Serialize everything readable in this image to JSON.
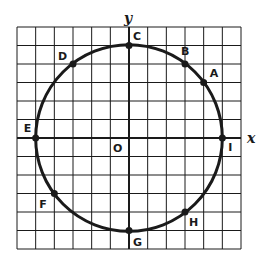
{
  "diagram": {
    "type": "circle-on-coordinate-grid",
    "grid": {
      "cells_x": 12,
      "cells_y": 12,
      "x_min": -6,
      "x_max": 6,
      "y_min": -6,
      "y_max": 6
    },
    "axes": {
      "x_label": "x",
      "y_label": "y",
      "origin_label": "O"
    },
    "circle": {
      "center": [
        0,
        0
      ],
      "radius": 5
    },
    "points": [
      {
        "label": "A",
        "x": 4,
        "y": 3
      },
      {
        "label": "B",
        "x": 3,
        "y": 4
      },
      {
        "label": "C",
        "x": 0,
        "y": 5
      },
      {
        "label": "D",
        "x": -3,
        "y": 4
      },
      {
        "label": "E",
        "x": -5,
        "y": 0
      },
      {
        "label": "F",
        "x": -4,
        "y": -3
      },
      {
        "label": "G",
        "x": 0,
        "y": -5
      },
      {
        "label": "H",
        "x": 3,
        "y": -4
      },
      {
        "label": "I",
        "x": 5,
        "y": 0
      }
    ],
    "colors": {
      "ink": "#1a1a1a",
      "background": "#ffffff"
    }
  }
}
